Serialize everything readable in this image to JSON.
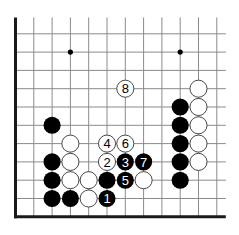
{
  "diagram": {
    "type": "go-board-partial",
    "grid": {
      "origin_x": 15.5,
      "origin_y": 15.5,
      "spacing": 18.3,
      "cols": 12,
      "rows": 12,
      "line_color": "#8a8a8a",
      "edge_color": "#1a1a1a",
      "left_edge": true,
      "bottom_edge": true,
      "top_edge": false,
      "right_edge": false
    },
    "hoshi": [
      {
        "col": 3,
        "row": 2
      },
      {
        "col": 9,
        "row": 2
      }
    ],
    "stones": [
      {
        "color": "black",
        "col": 2,
        "row": 6,
        "label": ""
      },
      {
        "color": "white",
        "col": 3,
        "row": 7,
        "label": ""
      },
      {
        "color": "black",
        "col": 2,
        "row": 8,
        "label": ""
      },
      {
        "color": "white",
        "col": 3,
        "row": 8,
        "label": ""
      },
      {
        "color": "black",
        "col": 2,
        "row": 9,
        "label": ""
      },
      {
        "color": "white",
        "col": 3,
        "row": 9,
        "label": ""
      },
      {
        "color": "white",
        "col": 4,
        "row": 9,
        "label": ""
      },
      {
        "color": "black",
        "col": 5,
        "row": 9,
        "label": ""
      },
      {
        "color": "black",
        "col": 2,
        "row": 10,
        "label": ""
      },
      {
        "color": "black",
        "col": 3,
        "row": 10,
        "label": ""
      },
      {
        "color": "white",
        "col": 4,
        "row": 10,
        "label": ""
      },
      {
        "color": "black",
        "col": 5,
        "row": 10,
        "label": "1"
      },
      {
        "color": "white",
        "col": 5,
        "row": 8,
        "label": "2"
      },
      {
        "color": "black",
        "col": 6,
        "row": 8,
        "label": "3"
      },
      {
        "color": "white",
        "col": 5,
        "row": 7,
        "label": "4"
      },
      {
        "color": "black",
        "col": 6,
        "row": 9,
        "label": "5"
      },
      {
        "color": "white",
        "col": 6,
        "row": 7,
        "label": "6"
      },
      {
        "color": "black",
        "col": 7,
        "row": 8,
        "label": "7"
      },
      {
        "color": "white",
        "col": 7,
        "row": 9,
        "label": ""
      },
      {
        "color": "white",
        "col": 6,
        "row": 4,
        "label": "8"
      },
      {
        "color": "white",
        "col": 10,
        "row": 4,
        "label": ""
      },
      {
        "color": "white",
        "col": 10,
        "row": 5,
        "label": ""
      },
      {
        "color": "white",
        "col": 10,
        "row": 6,
        "label": ""
      },
      {
        "color": "white",
        "col": 10,
        "row": 7,
        "label": ""
      },
      {
        "color": "white",
        "col": 10,
        "row": 8,
        "label": ""
      },
      {
        "color": "black",
        "col": 9,
        "row": 5,
        "label": ""
      },
      {
        "color": "black",
        "col": 9,
        "row": 6,
        "label": ""
      },
      {
        "color": "black",
        "col": 9,
        "row": 7,
        "label": ""
      },
      {
        "color": "black",
        "col": 9,
        "row": 8,
        "label": ""
      },
      {
        "color": "black",
        "col": 9,
        "row": 9,
        "label": ""
      }
    ],
    "colors": {
      "black_stone": "#000000",
      "white_stone": "#ffffff",
      "white_stroke": "#333333",
      "black_label": "#ffffff",
      "white_label": "#000000",
      "hoshi": "#000000"
    }
  }
}
